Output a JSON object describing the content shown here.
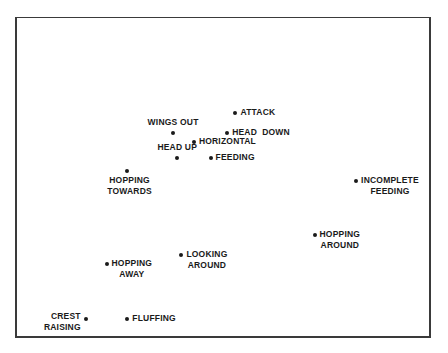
{
  "chart_data": {
    "type": "scatter",
    "title": "",
    "xlabel": "",
    "ylabel": "",
    "grid": false,
    "axes_ticks": false,
    "points": [
      {
        "id": "attack",
        "label": "ATTACK",
        "x": 0.53,
        "y": 0.3,
        "label_pos": "right"
      },
      {
        "id": "head-down",
        "label": "HEAD  DOWN",
        "x": 0.51,
        "y": 0.36,
        "label_pos": "right"
      },
      {
        "id": "wings-out",
        "label": "WINGS OUT",
        "x": 0.38,
        "y": 0.36,
        "label_pos": "above"
      },
      {
        "id": "horizontal",
        "label": "HORIZONTAL",
        "x": 0.43,
        "y": 0.39,
        "label_pos": "right"
      },
      {
        "id": "head-up",
        "label": "HEAD UP",
        "x": 0.39,
        "y": 0.44,
        "label_pos": "above"
      },
      {
        "id": "feeding",
        "label": "FEEDING",
        "x": 0.47,
        "y": 0.44,
        "label_pos": "right"
      },
      {
        "id": "hopping-towards",
        "label": "HOPPING\nTOWARDS",
        "x": 0.27,
        "y": 0.48,
        "label_pos": "below"
      },
      {
        "id": "incomplete-feeding",
        "label": "INCOMPLETE\nFEEDING",
        "x": 0.82,
        "y": 0.51,
        "label_pos": "right"
      },
      {
        "id": "hopping-around",
        "label": "HOPPING\nAROUND",
        "x": 0.72,
        "y": 0.68,
        "label_pos": "right"
      },
      {
        "id": "looking-around",
        "label": "LOOKING\nAROUND",
        "x": 0.4,
        "y": 0.74,
        "label_pos": "right"
      },
      {
        "id": "hopping-away",
        "label": "HOPPING\nAWAY",
        "x": 0.22,
        "y": 0.77,
        "label_pos": "right"
      },
      {
        "id": "crest-raising",
        "label": "CREST\nRAISING",
        "x": 0.17,
        "y": 0.94,
        "label_pos": "left"
      },
      {
        "id": "fluffing",
        "label": "FLUFFING",
        "x": 0.27,
        "y": 0.94,
        "label_pos": "right"
      }
    ]
  }
}
